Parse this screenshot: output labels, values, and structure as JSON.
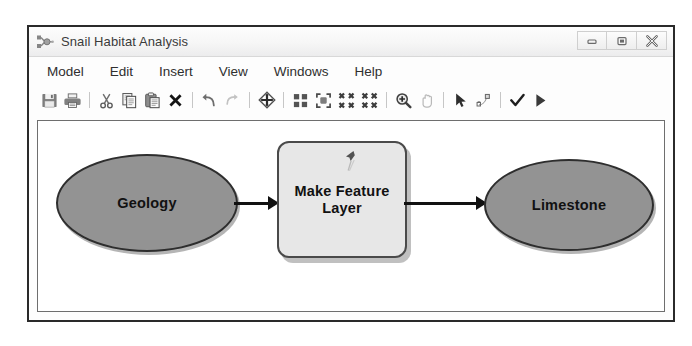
{
  "window": {
    "title": "Snail Habitat Analysis",
    "title_icon": "model-builder-icon",
    "controls": [
      {
        "name": "minimize-button",
        "icon": "minimize-icon",
        "label": "Minimize"
      },
      {
        "name": "maximize-button",
        "icon": "maximize-icon",
        "label": "Maximize"
      },
      {
        "name": "close-button",
        "icon": "close-icon",
        "label": "Close"
      }
    ]
  },
  "menu": {
    "items": [
      {
        "label": "Model"
      },
      {
        "label": "Edit"
      },
      {
        "label": "Insert"
      },
      {
        "label": "View"
      },
      {
        "label": "Windows"
      },
      {
        "label": "Help"
      }
    ]
  },
  "toolbar": {
    "buttons": [
      {
        "name": "save-button",
        "icon": "save-floppy-icon",
        "label": "Save"
      },
      {
        "name": "print-button",
        "icon": "printer-icon",
        "label": "Print"
      },
      {
        "name": "separator-1",
        "icon": "separator",
        "label": ""
      },
      {
        "name": "cut-button",
        "icon": "scissors-icon",
        "label": "Cut"
      },
      {
        "name": "copy-button",
        "icon": "copy-icon",
        "label": "Copy"
      },
      {
        "name": "paste-button",
        "icon": "paste-clipboard-icon",
        "label": "Paste"
      },
      {
        "name": "delete-button",
        "icon": "close-x-icon",
        "label": "Delete"
      },
      {
        "name": "separator-2",
        "icon": "separator",
        "label": ""
      },
      {
        "name": "undo-button",
        "icon": "undo-arrow-icon",
        "label": "Undo"
      },
      {
        "name": "redo-button",
        "icon": "redo-arrow-icon",
        "label": "Redo"
      },
      {
        "name": "separator-3",
        "icon": "separator",
        "label": ""
      },
      {
        "name": "add-data-button",
        "icon": "add-data-diamond-icon",
        "label": "Add Data or Tool"
      },
      {
        "name": "separator-4",
        "icon": "separator",
        "label": ""
      },
      {
        "name": "auto-layout-button",
        "icon": "auto-layout-grid-icon",
        "label": "Auto Layout"
      },
      {
        "name": "full-extent-button",
        "icon": "full-extent-icon",
        "label": "Full Extent"
      },
      {
        "name": "zoom-to-selected-button",
        "icon": "zoom-in-corners-icon",
        "label": "Zoom To Selected"
      },
      {
        "name": "fit-to-window-button",
        "icon": "zoom-out-corners-icon",
        "label": "Fit To Window"
      },
      {
        "name": "separator-5",
        "icon": "separator",
        "label": ""
      },
      {
        "name": "zoom-in-button",
        "icon": "magnifier-plus-icon",
        "label": "Zoom In"
      },
      {
        "name": "pan-button",
        "icon": "pan-hand-icon",
        "label": "Pan"
      },
      {
        "name": "separator-6",
        "icon": "separator",
        "label": ""
      },
      {
        "name": "select-button",
        "icon": "pointer-arrow-icon",
        "label": "Select"
      },
      {
        "name": "connect-button",
        "icon": "connect-link-icon",
        "label": "Connect"
      },
      {
        "name": "separator-7",
        "icon": "separator",
        "label": ""
      },
      {
        "name": "validate-button",
        "icon": "checkmark-icon",
        "label": "Validate Entire Model"
      },
      {
        "name": "run-button",
        "icon": "play-triangle-icon",
        "label": "Run"
      }
    ]
  },
  "canvas": {
    "nodes": [
      {
        "id": "geology",
        "label": "Geology",
        "shape": "ellipse",
        "role": "input-data",
        "fill": "#939393"
      },
      {
        "id": "make-feature-layer",
        "label": "Make Feature Layer",
        "shape": "rounded-rectangle",
        "role": "tool",
        "fill": "#e7e7e7"
      },
      {
        "id": "limestone",
        "label": "Limestone",
        "shape": "ellipse",
        "role": "derived-data",
        "fill": "#939393"
      }
    ],
    "connectors": [
      {
        "id": "geology-to-process",
        "from": "geology",
        "to": "make-feature-layer"
      },
      {
        "id": "process-to-limestone",
        "from": "make-feature-layer",
        "to": "limestone"
      }
    ]
  }
}
